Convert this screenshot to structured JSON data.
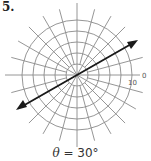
{
  "problem_number": "5.",
  "diagram": {
    "type": "polar-grid",
    "center": [
      77,
      75
    ],
    "circle_count": 5,
    "spoke_count": 24,
    "axis_label_angle": "0",
    "radius_label": "10",
    "line_angle_deg": 30,
    "colors": {
      "grid": "#8a8a8a",
      "line": "#1a1a1a",
      "text": "#333333"
    }
  },
  "caption": {
    "theta": "θ",
    "equals": " = 30°"
  }
}
